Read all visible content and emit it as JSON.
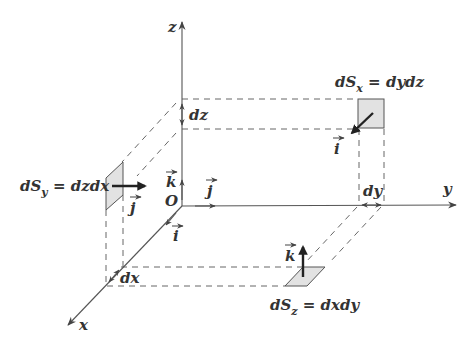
{
  "diagram": {
    "type": "3d-coordinate-surface-elements",
    "origin_label": "O",
    "axes": {
      "x": {
        "label": "x"
      },
      "y": {
        "label": "y"
      },
      "z": {
        "label": "z"
      }
    },
    "unit_vectors": {
      "i": "i",
      "j": "j",
      "k": "k"
    },
    "increments": {
      "dx": "dx",
      "dy": "dy",
      "dz": "dz"
    },
    "surface_elements": [
      {
        "id": "dSx",
        "main": "dS",
        "sub": "x",
        "rhs": " = dydz",
        "normal": "i"
      },
      {
        "id": "dSy",
        "main": "dS",
        "sub": "y",
        "rhs": " = dzdx",
        "normal": "j"
      },
      {
        "id": "dSz",
        "main": "dS",
        "sub": "z",
        "rhs": " = dxdy",
        "normal": "k"
      }
    ],
    "colors": {
      "axis": "#555555",
      "patch_fill": "#e2e2e2",
      "text": "#333333",
      "background": "#ffffff"
    }
  }
}
